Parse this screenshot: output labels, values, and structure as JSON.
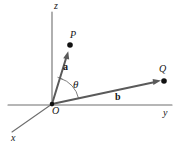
{
  "figure": {
    "background_color": "#ffffff",
    "width": 179,
    "height": 146
  },
  "axes": [
    {
      "name": "z-axis",
      "label": "z",
      "label_x": 54,
      "label_y": 1,
      "x1": 52,
      "y1": 12,
      "x2": 52,
      "y2": 106,
      "color": "#6e6e6e"
    },
    {
      "name": "y-axis",
      "label": "y",
      "label_x": 163,
      "label_y": 108,
      "x1": 8,
      "y1": 105,
      "x2": 172,
      "y2": 105,
      "color": "#6e6e6e"
    },
    {
      "name": "x-axis",
      "label": "x",
      "label_x": 11,
      "label_y": 133,
      "x1": 52,
      "y1": 104,
      "x2": 12,
      "y2": 132,
      "color": "#6e6e6e"
    }
  ],
  "origin": {
    "label": "O",
    "x": 52,
    "y": 104,
    "label_x": 52,
    "label_y": 106
  },
  "points": [
    {
      "name": "point-P",
      "label": "P",
      "x": 70,
      "y": 45,
      "label_x": 70,
      "label_y": 30,
      "color": "#111111"
    },
    {
      "name": "point-Q",
      "label": "Q",
      "x": 164,
      "y": 81,
      "label_x": 159,
      "label_y": 64,
      "color": "#111111"
    }
  ],
  "vectors": [
    {
      "name": "vector-a",
      "label": "a",
      "from_x": 52,
      "from_y": 104,
      "to_x": 68,
      "to_y": 52,
      "label_x": 63,
      "label_y": 62,
      "color": "#5a5a5a",
      "terminus_point": "P"
    },
    {
      "name": "vector-b",
      "label": "b",
      "from_x": 52,
      "from_y": 104,
      "to_x": 160,
      "to_y": 81,
      "label_x": 115,
      "label_y": 92,
      "color": "#5a5a5a",
      "terminus_point": "Q"
    }
  ],
  "angle": {
    "name": "angle-theta",
    "label": "θ",
    "label_x": 73,
    "label_y": 79,
    "vertex_x": 52,
    "vertex_y": 104,
    "radius": 27,
    "between": [
      "vector-a",
      "vector-b"
    ],
    "color": "#6e6e6e"
  },
  "colors": {
    "axis": "#6e6e6e",
    "vector": "#5a5a5a",
    "point": "#111111",
    "text": "#151515",
    "background": "#ffffff"
  }
}
